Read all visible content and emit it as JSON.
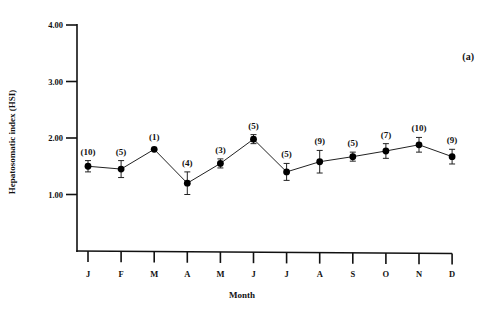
{
  "chart_data": {
    "type": "line",
    "title": "",
    "panel_label": "(a)",
    "xlabel": "Month",
    "ylabel": "Hepatosomatic index (HSI)",
    "ylim": [
      0,
      4
    ],
    "yticks": [
      "1.00",
      "2.00",
      "3.00",
      "4.00"
    ],
    "ytick_values": [
      1,
      2,
      3,
      4
    ],
    "categories": [
      "J",
      "F",
      "M",
      "A",
      "M",
      "J",
      "J",
      "A",
      "S",
      "O",
      "N",
      "D"
    ],
    "series": [
      {
        "name": "HSI",
        "values": [
          1.5,
          1.45,
          1.8,
          1.2,
          1.55,
          1.98,
          1.4,
          1.58,
          1.67,
          1.77,
          1.88,
          1.67
        ],
        "error": [
          0.1,
          0.15,
          0.0,
          0.2,
          0.08,
          0.08,
          0.15,
          0.2,
          0.08,
          0.13,
          0.13,
          0.13
        ],
        "sample_sizes": [
          "(10)",
          "(5)",
          "(1)",
          "(4)",
          "(3)",
          "(5)",
          "(5)",
          "(9)",
          "(5)",
          "(7)",
          "(10)",
          "(9)"
        ]
      }
    ],
    "grid": false,
    "legend": "none"
  },
  "colors": {
    "line": "#222222",
    "marker": "#000000",
    "axis": "#111111"
  }
}
